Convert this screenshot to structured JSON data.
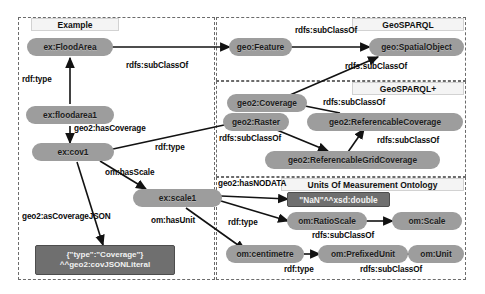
{
  "diagram": {
    "panels": [
      {
        "id": "example",
        "label": "Example"
      },
      {
        "id": "geosparql",
        "label": "GeoSPARQL"
      },
      {
        "id": "geosparqlplus",
        "label": "GeoSPARQL+"
      },
      {
        "id": "uom",
        "label": "Units Of Measurement Ontology"
      }
    ],
    "nodes": [
      {
        "id": "ex-floodarea",
        "label": "ex:FloodArea"
      },
      {
        "id": "ex-floodarea1",
        "label": "ex:floodarea1"
      },
      {
        "id": "ex-cov1",
        "label": "ex:cov1"
      },
      {
        "id": "ex-scale1",
        "label": "ex:scale1"
      },
      {
        "id": "json-literal-1",
        "label": "{\"type\":\"Coverage\"}"
      },
      {
        "id": "json-literal-2",
        "label": "^^geo2:covJSONLiteral"
      },
      {
        "id": "geo-feature",
        "label": "geo:Feature"
      },
      {
        "id": "geo-spatialobject",
        "label": "geo:SpatialObject"
      },
      {
        "id": "geo2-coverage",
        "label": "geo2:Coverage"
      },
      {
        "id": "geo2-raster",
        "label": "geo2:Raster"
      },
      {
        "id": "geo2-referencablecoverage",
        "label": "geo2:ReferencableCoverage"
      },
      {
        "id": "geo2-referencablegridcoverage",
        "label": "geo2:ReferencableGridCoverage"
      },
      {
        "id": "nan-literal",
        "label": "\"NaN\"^^xsd:double"
      },
      {
        "id": "om-ratioscale",
        "label": "om:RatioScale"
      },
      {
        "id": "om-scale",
        "label": "om:Scale"
      },
      {
        "id": "om-centimetre",
        "label": "om:centimetre"
      },
      {
        "id": "om-prefixedunit",
        "label": "om:PrefixedUnit"
      },
      {
        "id": "om-unit",
        "label": "om:Unit"
      }
    ],
    "edges": [
      {
        "id": "e1",
        "label": "rdf:type",
        "from": "ex-floodarea1",
        "to": "ex-floodarea"
      },
      {
        "id": "e2",
        "label": "rdfs:subClassOf",
        "from": "ex-floodarea",
        "to": "geo-feature"
      },
      {
        "id": "e3",
        "label": "geo2:hasCoverage",
        "from": "ex-floodarea1",
        "to": "ex-cov1"
      },
      {
        "id": "e4",
        "label": "rdf:type",
        "from": "ex-cov1",
        "to": "geo2-raster"
      },
      {
        "id": "e5",
        "label": "om:hasScale",
        "from": "ex-cov1",
        "to": "ex-scale1"
      },
      {
        "id": "e6",
        "label": "geo2:asCoverageJSON",
        "from": "ex-cov1",
        "to": "json-literal-1"
      },
      {
        "id": "e7",
        "label": "om:hasUnit",
        "from": "ex-scale1",
        "to": "om-centimetre"
      },
      {
        "id": "e8",
        "label": "geo2:hasNODATA",
        "from": "ex-scale1",
        "to": "nan-literal"
      },
      {
        "id": "e9",
        "label": "rdf:type",
        "from": "ex-scale1",
        "to": "om-ratioscale"
      },
      {
        "id": "e10",
        "label": "rdfs:subClassOf",
        "from": "geo-feature",
        "to": "geo-spatialobject"
      },
      {
        "id": "e11",
        "label": "rdfs:subClassOf",
        "from": "geo2-coverage",
        "to": "geo-spatialobject"
      },
      {
        "id": "e12",
        "label": "rdfs:subClassOf",
        "from": "geo2-referencablecoverage",
        "to": "geo2-coverage"
      },
      {
        "id": "e13",
        "label": "rdfs:subClassOf",
        "from": "geo2-raster",
        "to": "geo2-referencablegridcoverage"
      },
      {
        "id": "e14",
        "label": "rdfs:subClassOf",
        "from": "geo2-referencablegridcoverage",
        "to": "geo2-referencablecoverage"
      },
      {
        "id": "e15",
        "label": "rdfs:subClassOf",
        "from": "om-ratioscale",
        "to": "om-scale"
      },
      {
        "id": "e16",
        "label": "rdf:type",
        "from": "om-centimetre",
        "to": "om-prefixedunit"
      },
      {
        "id": "e17",
        "label": "rdfs:subClassOf",
        "from": "om-prefixedunit",
        "to": "om-unit"
      }
    ],
    "edge_labels": [
      {
        "id": "l-rdftype-1",
        "text": "rdf:type"
      },
      {
        "id": "l-subclassof-1",
        "text": "rdfs:subClassOf"
      },
      {
        "id": "l-hascoverage",
        "text": "geo2:hasCoverage"
      },
      {
        "id": "l-rdftype-2",
        "text": "rdf:type"
      },
      {
        "id": "l-hasscale",
        "text": "om:hasScale"
      },
      {
        "id": "l-ascoveragejson",
        "text": "geo2:asCoverageJSON"
      },
      {
        "id": "l-hasunit",
        "text": "om:hasUnit"
      },
      {
        "id": "l-hasnodata",
        "text": "geo2:hasNODATA"
      },
      {
        "id": "l-rdftype-3",
        "text": "rdf:type"
      },
      {
        "id": "l-subclassof-2",
        "text": "rdfs:subClassOf"
      },
      {
        "id": "l-subclassof-3",
        "text": "rdfs:subClassOf"
      },
      {
        "id": "l-subclassof-4",
        "text": "rdfs:subClassOf"
      },
      {
        "id": "l-subclassof-5",
        "text": "rdfs:subClassOf"
      },
      {
        "id": "l-subclassof-6",
        "text": "rdfs:subClassOf"
      },
      {
        "id": "l-subclassof-7",
        "text": "rdfs:subClassOf"
      },
      {
        "id": "l-rdftype-4",
        "text": "rdf:type"
      },
      {
        "id": "l-subclassof-8",
        "text": "rdfs:subClassOf"
      }
    ],
    "colors": {
      "node_fill": "#9d9d9d",
      "literal_fill": "#6f6f6f",
      "panel_border": "#6b6b6b",
      "title_fill": "#f4f4f4",
      "edge_stroke": "#121212",
      "background": "#ffffff"
    }
  }
}
